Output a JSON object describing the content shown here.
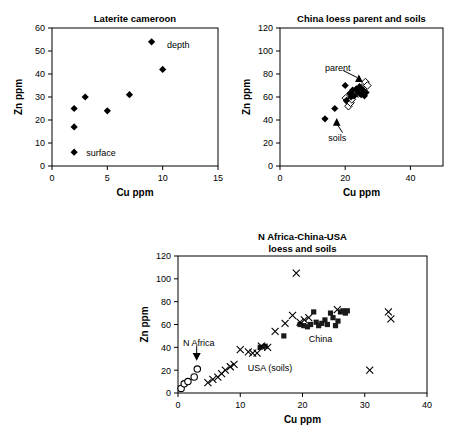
{
  "figure": {
    "axis_label_x": "Cu ppm",
    "axis_label_y": "Zn ppm"
  },
  "chart_data": [
    {
      "type": "scatter",
      "id": "laterite-cameroon",
      "title": "Laterite cameroon",
      "xlabel": "Cu ppm",
      "ylabel": "Zn ppm",
      "xlim": [
        0,
        15
      ],
      "ylim": [
        0,
        60
      ],
      "xticks": [
        0,
        5,
        10,
        15
      ],
      "yticks": [
        0,
        10,
        20,
        30,
        40,
        50,
        60
      ],
      "grid": false,
      "legend": "none",
      "series": [
        {
          "name": "laterite",
          "marker": "filled-diamond",
          "points": [
            [
              2,
              6
            ],
            [
              2,
              17
            ],
            [
              2,
              25
            ],
            [
              3,
              30
            ],
            [
              5,
              24
            ],
            [
              7,
              31
            ],
            [
              9,
              54
            ],
            [
              10,
              42
            ]
          ]
        }
      ],
      "annotations": [
        {
          "text": "depth",
          "x": 10.4,
          "y": 53,
          "anchor": "start"
        },
        {
          "text": "surface",
          "x": 3.1,
          "y": 6,
          "anchor": "start"
        }
      ]
    },
    {
      "type": "scatter",
      "id": "china-loess-parent-soils",
      "title": "China loess parent and soils",
      "xlabel": "Cu ppm",
      "ylabel": "Zn ppm",
      "xlim": [
        0,
        50
      ],
      "ylim": [
        0,
        120
      ],
      "xticks": [
        0,
        20,
        40
      ],
      "yticks": [
        0,
        20,
        40,
        60,
        80,
        100,
        120
      ],
      "grid": false,
      "legend": "none",
      "series": [
        {
          "name": "parent",
          "marker": "open-diamond",
          "points": [
            [
              20.2,
              59
            ],
            [
              20.8,
              56
            ],
            [
              21.0,
              52
            ],
            [
              21.6,
              55
            ],
            [
              22.0,
              58
            ],
            [
              22.6,
              62
            ],
            [
              23.3,
              65
            ],
            [
              24.0,
              63
            ],
            [
              25.0,
              68
            ],
            [
              26.2,
              73
            ],
            [
              26.8,
              70
            ],
            [
              25.6,
              65
            ]
          ]
        },
        {
          "name": "soils",
          "marker": "filled-diamond",
          "points": [
            [
              13.8,
              41
            ],
            [
              16.8,
              50
            ],
            [
              20.4,
              57
            ],
            [
              20.0,
              70
            ],
            [
              21.4,
              63
            ],
            [
              21.8,
              60
            ],
            [
              22.3,
              66
            ],
            [
              22.8,
              61
            ],
            [
              23.4,
              67
            ],
            [
              23.9,
              64
            ],
            [
              24.4,
              69
            ],
            [
              24.9,
              62
            ],
            [
              25.4,
              66
            ],
            [
              25.9,
              61
            ],
            [
              26.4,
              64
            ]
          ]
        },
        {
          "name": "marker-parent",
          "marker": "filled-triangle",
          "points": [
            [
              24.2,
              76
            ]
          ]
        },
        {
          "name": "marker-soils",
          "marker": "filled-triangle",
          "points": [
            [
              17.4,
              38
            ]
          ]
        }
      ],
      "annotations": [
        {
          "text": "parent",
          "x": 13.8,
          "y": 86,
          "anchor": "start"
        },
        {
          "text": "soils",
          "x": 14.8,
          "y": 25,
          "anchor": "start"
        }
      ],
      "leaders": [
        {
          "from": [
            19.4,
            83
          ],
          "to": [
            23.6,
            77
          ]
        },
        {
          "from": [
            19.2,
            29
          ],
          "to": [
            17.6,
            36
          ]
        }
      ]
    },
    {
      "type": "scatter",
      "id": "n-africa-china-usa",
      "title_line1": "N Africa-China-USA",
      "title_line2": "loess and soils",
      "title": "N Africa-China-USA loess and soils",
      "xlabel": "Cu ppm",
      "ylabel": "Zn ppm",
      "xlim": [
        0,
        40
      ],
      "ylim": [
        0,
        120
      ],
      "xticks": [
        0,
        10,
        20,
        30,
        40
      ],
      "yticks": [
        0,
        20,
        40,
        60,
        80,
        100,
        120
      ],
      "grid": false,
      "legend": "none",
      "series": [
        {
          "name": "N Africa",
          "marker": "open-circle",
          "points": [
            [
              0.5,
              4
            ],
            [
              1.0,
              8
            ],
            [
              1.6,
              10
            ],
            [
              2.6,
              14
            ],
            [
              3.1,
              21
            ]
          ]
        },
        {
          "name": "China",
          "marker": "filled-square",
          "points": [
            [
              13.2,
              40
            ],
            [
              14.0,
              41
            ],
            [
              17.0,
              50
            ],
            [
              19.6,
              60
            ],
            [
              20.2,
              59
            ],
            [
              20.8,
              58
            ],
            [
              21.3,
              60
            ],
            [
              21.8,
              71
            ],
            [
              22.2,
              62
            ],
            [
              22.6,
              59
            ],
            [
              23.1,
              61
            ],
            [
              23.6,
              64
            ],
            [
              24.0,
              60
            ],
            [
              24.5,
              70
            ],
            [
              24.9,
              66
            ],
            [
              25.3,
              59
            ],
            [
              25.7,
              63
            ],
            [
              26.1,
              71
            ],
            [
              26.5,
              72
            ],
            [
              26.9,
              70
            ],
            [
              27.2,
              72
            ]
          ]
        },
        {
          "name": "USA (soils)",
          "marker": "cross-x",
          "points": [
            [
              4.8,
              9
            ],
            [
              5.6,
              12
            ],
            [
              6.4,
              14
            ],
            [
              7.0,
              17
            ],
            [
              7.6,
              20
            ],
            [
              8.4,
              23
            ],
            [
              9.0,
              25
            ],
            [
              10.0,
              38
            ],
            [
              11.3,
              36
            ],
            [
              12.0,
              35
            ],
            [
              12.7,
              35
            ],
            [
              13.4,
              41
            ],
            [
              14.4,
              40
            ],
            [
              15.6,
              54
            ],
            [
              17.2,
              61
            ],
            [
              18.4,
              68
            ],
            [
              19.0,
              105
            ],
            [
              19.6,
              62
            ],
            [
              20.3,
              64
            ],
            [
              21.0,
              66
            ],
            [
              25.6,
              73
            ],
            [
              30.8,
              20
            ],
            [
              33.8,
              71
            ],
            [
              34.2,
              65
            ]
          ]
        },
        {
          "name": "marker-n-africa",
          "marker": "filled-triangle-down",
          "points": [
            [
              3.0,
              32
            ]
          ]
        }
      ],
      "annotations": [
        {
          "text": "N Africa",
          "x": 0.8,
          "y": 44,
          "anchor": "start"
        },
        {
          "text": "China",
          "x": 21.0,
          "y": 48,
          "anchor": "start"
        },
        {
          "text": "USA (soils)",
          "x": 11.2,
          "y": 22,
          "anchor": "start"
        }
      ],
      "leaders": [
        {
          "from": [
            3.0,
            41
          ],
          "to": [
            3.0,
            35
          ]
        }
      ]
    }
  ]
}
